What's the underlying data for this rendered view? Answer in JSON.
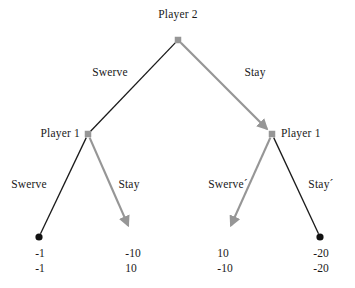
{
  "diagram": {
    "type": "extensive-form-game-tree",
    "colors": {
      "edge_dark": "#1a1a1a",
      "edge_highlight": "#969696",
      "node_decision": "#969696",
      "node_terminal": "#111111",
      "background": "#ffffff",
      "text": "#1a1a1a"
    },
    "nodes": [
      {
        "id": "root",
        "label": "Player 2",
        "kind": "decision",
        "shape": "square",
        "x": 178,
        "y": 40,
        "label_x": 178,
        "label_y": 8,
        "label_align": "center"
      },
      {
        "id": "left",
        "label": "Player 1",
        "kind": "decision",
        "shape": "square",
        "x": 88,
        "y": 134,
        "label_x": 80,
        "label_y": 127,
        "label_align": "right"
      },
      {
        "id": "right",
        "label": "Player 1",
        "kind": "decision",
        "shape": "square",
        "x": 272,
        "y": 134,
        "label_x": 281,
        "label_y": 127,
        "label_align": "left"
      }
    ],
    "edges": [
      {
        "id": "root-swerve",
        "from": "root",
        "to": "left",
        "label": "Swerve",
        "style": "dark",
        "arrow": false,
        "label_x": 110,
        "label_y": 66,
        "label_align": "center"
      },
      {
        "id": "root-stay",
        "from": "root",
        "to": "right",
        "label": "Stay",
        "style": "highlight",
        "arrow": true,
        "label_x": 255,
        "label_y": 66,
        "label_align": "center"
      },
      {
        "id": "left-swerve",
        "from": "left",
        "to": "t1",
        "label": "Swerve",
        "style": "dark",
        "arrow": false,
        "label_x": 29,
        "label_y": 178,
        "label_align": "center"
      },
      {
        "id": "left-stay",
        "from": "left",
        "to": "t2",
        "label": "Stay",
        "style": "highlight",
        "arrow": true,
        "label_x": 129,
        "label_y": 178,
        "label_align": "center"
      },
      {
        "id": "right-swerve",
        "from": "right",
        "to": "t3",
        "label": "Swerve´",
        "style": "highlight",
        "arrow": true,
        "label_x": 228,
        "label_y": 178,
        "label_align": "center"
      },
      {
        "id": "right-stay",
        "from": "right",
        "to": "t4",
        "label": "Stay´",
        "style": "dark",
        "arrow": false,
        "label_x": 321,
        "label_y": 178,
        "label_align": "center"
      }
    ],
    "terminals": [
      {
        "id": "t1",
        "x": 39,
        "y": 237,
        "marker": "dot",
        "payoff_top": "-1",
        "payoff_bottom": "-1",
        "payoff_x": 40,
        "payoff_y": 246
      },
      {
        "id": "t2",
        "x": 131,
        "y": 232,
        "marker": "arrow",
        "payoff_top": "-10",
        "payoff_bottom": "10",
        "payoff_x": 133,
        "payoff_y": 246
      },
      {
        "id": "t3",
        "x": 228,
        "y": 232,
        "marker": "arrow",
        "payoff_top": "10",
        "payoff_bottom": "-10",
        "payoff_x": 225,
        "payoff_y": 246
      },
      {
        "id": "t4",
        "x": 320,
        "y": 237,
        "marker": "dot",
        "payoff_top": "-20",
        "payoff_bottom": "-20",
        "payoff_x": 321,
        "payoff_y": 246
      }
    ]
  }
}
